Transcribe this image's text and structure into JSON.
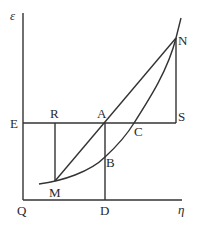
{
  "diagram": {
    "type": "geometric-construction",
    "labels": {
      "epsilon": "ε",
      "eta": "η",
      "E": "E",
      "R": "R",
      "A": "A",
      "S": "S",
      "N": "N",
      "C": "C",
      "B": "B",
      "M": "M",
      "Q": "Q",
      "D": "D"
    },
    "points": {
      "Q": [
        23,
        200
      ],
      "E": [
        23,
        123
      ],
      "R": [
        55,
        123
      ],
      "A": [
        105,
        123
      ],
      "C": [
        134,
        123
      ],
      "S": [
        176,
        123
      ],
      "N": [
        176,
        38
      ],
      "M": [
        55,
        181
      ],
      "B": [
        105,
        157
      ],
      "D": [
        105,
        200
      ]
    },
    "elements": [
      "vertical axis Q-ε",
      "horizontal axis Q-η",
      "horizontal line E-S",
      "vertical segment R-M",
      "vertical segment A-D",
      "vertical segment S-N",
      "straight line M-N through A",
      "convex curve through M, B, C, N"
    ],
    "colors": {
      "stroke": "#333333",
      "text": "#2a2a2a"
    }
  }
}
